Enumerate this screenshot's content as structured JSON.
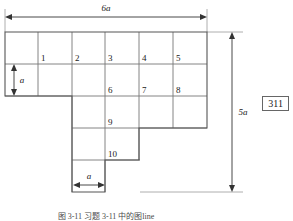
{
  "figure": {
    "type": "staircase-polyomino-grid-diagram",
    "cell_labels": [
      "1",
      "2",
      "3",
      "4",
      "5",
      "6",
      "7",
      "8",
      "9",
      "10"
    ],
    "dimensions": {
      "top_width": "6a",
      "right_height": "5a",
      "left_unit_height": "a",
      "bottom_unit_width": "a"
    },
    "caption": "图 3-11    习题 3-11 中的图line",
    "page_number": "311",
    "colors": {
      "grid_stroke": "#777777",
      "outline_stroke": "#555555",
      "dimension_stroke": "#333333",
      "text": "#1a1a1a",
      "background": "#ffffff"
    },
    "grid": {
      "columns": 6,
      "rows": 5,
      "cell_size_px": 33.7,
      "origin_x": 5,
      "origin_y": 32,
      "row_extents": [
        {
          "row": 1,
          "start_col": 1,
          "end_col": 6
        },
        {
          "row": 2,
          "start_col": 1,
          "end_col": 6
        },
        {
          "row": 3,
          "start_col": 3,
          "end_col": 6
        },
        {
          "row": 4,
          "start_col": 3,
          "end_col": 5
        },
        {
          "row": 5,
          "start_col": 3,
          "end_col": 4
        }
      ],
      "labeled_cells": [
        {
          "label": "1",
          "row": 1,
          "col": 2
        },
        {
          "label": "2",
          "row": 1,
          "col": 3
        },
        {
          "label": "3",
          "row": 1,
          "col": 4
        },
        {
          "label": "4",
          "row": 1,
          "col": 5
        },
        {
          "label": "5",
          "row": 1,
          "col": 6
        },
        {
          "label": "6",
          "row": 2,
          "col": 4
        },
        {
          "label": "7",
          "row": 2,
          "col": 5
        },
        {
          "label": "8",
          "row": 2,
          "col": 6
        },
        {
          "label": "9",
          "row": 3,
          "col": 4
        },
        {
          "label": "10",
          "row": 4,
          "col": 4
        }
      ]
    }
  }
}
